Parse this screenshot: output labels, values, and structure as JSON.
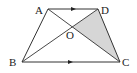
{
  "diagram": {
    "type": "trapezoid",
    "points": {
      "A": {
        "label": "A",
        "x": 48,
        "y": 9,
        "lx": 35,
        "ly": 14
      },
      "D": {
        "label": "D",
        "x": 98,
        "y": 9,
        "lx": 101,
        "ly": 14
      },
      "B": {
        "label": "B",
        "x": 22,
        "y": 62,
        "lx": 9,
        "ly": 66
      },
      "C": {
        "label": "C",
        "x": 120,
        "y": 62,
        "lx": 122,
        "ly": 66
      },
      "O": {
        "label": "O",
        "x": 72.3,
        "y": 26.9,
        "lx": 66,
        "ly": 39
      }
    },
    "shaded_region": [
      "O",
      "D",
      "C"
    ],
    "parallel_marks": [
      "AD",
      "BC"
    ],
    "colors": {
      "stroke": "#333333",
      "shade": "#d6d6d6",
      "label": "#222222"
    }
  }
}
